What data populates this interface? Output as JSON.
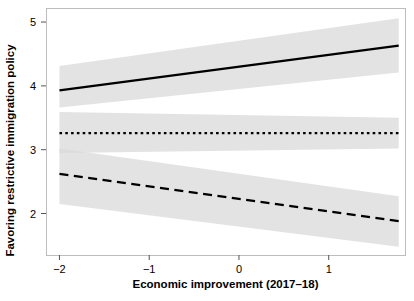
{
  "chart_data": {
    "type": "line",
    "title": "",
    "xlabel": "Economic improvement (2017–18)",
    "ylabel": "Favoring restrictive immigration policy",
    "xlim": [
      -2.15,
      1.85
    ],
    "ylim": [
      1.35,
      5.22
    ],
    "xticks": [
      -2,
      -1,
      0,
      1
    ],
    "xtick_labels": [
      "−2",
      "−1",
      "0",
      "1"
    ],
    "yticks": [
      2,
      3,
      4,
      5
    ],
    "ytick_labels": [
      "2",
      "3",
      "4",
      "5"
    ],
    "grid": false,
    "legend": "none",
    "band_color": "#d9d9d9",
    "line_color": "#000000",
    "frame_color": "#bdbdbd",
    "background": "#ffffff",
    "x": [
      -2.0,
      1.78
    ],
    "series": [
      {
        "name": "solid-line",
        "style": "solid",
        "values": [
          3.93,
          4.63
        ],
        "band_lower": [
          3.66,
          4.21
        ],
        "band_upper": [
          4.31,
          5.06
        ]
      },
      {
        "name": "dotted-line",
        "style": "dotted",
        "values": [
          3.26,
          3.26
        ],
        "band_lower": [
          2.95,
          3.02
        ],
        "band_upper": [
          3.59,
          3.5
        ]
      },
      {
        "name": "dashed-line",
        "style": "dashed",
        "values": [
          2.62,
          1.88
        ],
        "band_lower": [
          2.15,
          1.48
        ],
        "band_upper": [
          3.02,
          2.27
        ]
      }
    ]
  },
  "axes": {
    "y_axis_label": "Favoring restrictive immigration policy",
    "x_axis_label": "Economic improvement (2017–18)"
  }
}
